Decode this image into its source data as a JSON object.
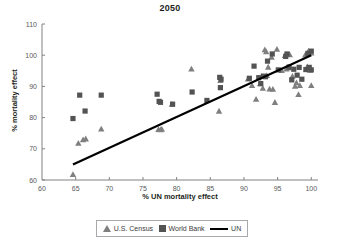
{
  "chart_data": {
    "type": "scatter",
    "title": "2050",
    "xlabel": "% UN mortality effect",
    "ylabel": "% mortality effect",
    "xlim": [
      60,
      101
    ],
    "ylim": [
      60,
      110
    ],
    "xticks": [
      60,
      65,
      70,
      75,
      80,
      85,
      90,
      95,
      100
    ],
    "yticks": [
      60,
      70,
      80,
      90,
      100,
      110
    ],
    "grid": false,
    "legend_position": "bottom",
    "legend": [
      "U.S. Census",
      "World Bank",
      "UN"
    ],
    "colors": {
      "us_census": "#7f7f7f",
      "world_bank": "#535353",
      "un_line": "#000000",
      "axis": "#808285",
      "text": "#3a3a3a"
    },
    "series": [
      {
        "name": "U.S. Census",
        "marker": "triangle",
        "color": "#7f7f7f",
        "points": [
          [
            64.6,
            61.8
          ],
          [
            65.4,
            71.8
          ],
          [
            66.1,
            72.9
          ],
          [
            66.5,
            73.2
          ],
          [
            68.8,
            76.4
          ],
          [
            77.3,
            76.2
          ],
          [
            77.6,
            76.1
          ],
          [
            77.8,
            76.3
          ],
          [
            79.3,
            84.3
          ],
          [
            82.2,
            95.6
          ],
          [
            86.3,
            82.1
          ],
          [
            86.5,
            91.9
          ],
          [
            90.6,
            92.4
          ],
          [
            91.2,
            90.3
          ],
          [
            91.8,
            85.9
          ],
          [
            92.4,
            90.9
          ],
          [
            92.6,
            93.2
          ],
          [
            92.8,
            89.4
          ],
          [
            93.1,
            101.8
          ],
          [
            93.3,
            101.1
          ],
          [
            93.4,
            93.5
          ],
          [
            93.6,
            96.2
          ],
          [
            93.8,
            89.2
          ],
          [
            94.1,
            99.4
          ],
          [
            94.3,
            89.1
          ],
          [
            94.6,
            84.9
          ],
          [
            94.9,
            101.9
          ],
          [
            95.6,
            95.1
          ],
          [
            96.1,
            99.9
          ],
          [
            96.3,
            95.6
          ],
          [
            96.5,
            95.9
          ],
          [
            96.6,
            96.1
          ],
          [
            96.8,
            100.2
          ],
          [
            97.2,
            93.3
          ],
          [
            97.6,
            90.1
          ],
          [
            97.8,
            91.2
          ],
          [
            98.1,
            87.4
          ],
          [
            98.3,
            90.3
          ],
          [
            99.1,
            100.1
          ],
          [
            99.4,
            96.3
          ],
          [
            99.6,
            101.4
          ],
          [
            99.8,
            95.2
          ],
          [
            100.0,
            90.3
          ],
          [
            100.0,
            100.7
          ]
        ]
      },
      {
        "name": "World Bank",
        "marker": "square",
        "color": "#535353",
        "points": [
          [
            64.6,
            79.7
          ],
          [
            65.6,
            87.2
          ],
          [
            66.4,
            82.1
          ],
          [
            68.8,
            87.2
          ],
          [
            77.1,
            87.5
          ],
          [
            77.4,
            85.2
          ],
          [
            77.6,
            84.9
          ],
          [
            79.4,
            84.3
          ],
          [
            82.3,
            88.2
          ],
          [
            84.5,
            85.5
          ],
          [
            86.4,
            92.9
          ],
          [
            86.5,
            89.6
          ],
          [
            86.6,
            92.3
          ],
          [
            90.8,
            92.6
          ],
          [
            91.5,
            96.5
          ],
          [
            92.2,
            92.8
          ],
          [
            92.5,
            90.9
          ],
          [
            92.9,
            93.3
          ],
          [
            93.2,
            93.1
          ],
          [
            93.5,
            98.1
          ],
          [
            94.2,
            100.4
          ],
          [
            95.1,
            95.3
          ],
          [
            96.2,
            99.6
          ],
          [
            96.4,
            100.4
          ],
          [
            96.7,
            96.2
          ],
          [
            97.1,
            92.1
          ],
          [
            97.4,
            95.5
          ],
          [
            97.9,
            93.6
          ],
          [
            98.2,
            96.1
          ],
          [
            98.6,
            92.3
          ],
          [
            99.2,
            95.4
          ],
          [
            99.5,
            100.6
          ],
          [
            99.7,
            96.1
          ],
          [
            100.0,
            95.3
          ],
          [
            100.0,
            101.3
          ]
        ]
      },
      {
        "name": "UN",
        "marker": "line",
        "color": "#000000",
        "line": [
          [
            64.6,
            65.0
          ],
          [
            100.0,
            100.0
          ]
        ]
      }
    ]
  }
}
